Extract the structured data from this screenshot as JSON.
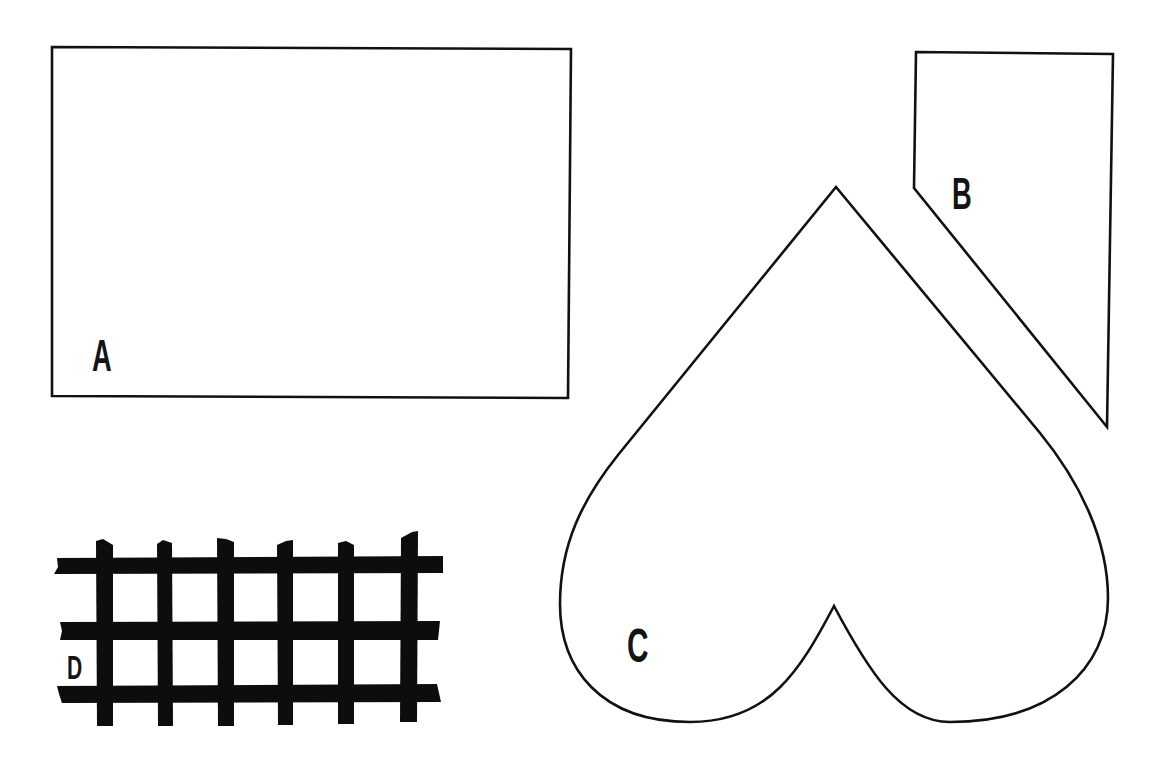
{
  "diagram": {
    "type": "pattern-pieces",
    "stroke_color": "#111111",
    "fill_color": "#ffffff",
    "background_color": "#ffffff",
    "shapes": [
      {
        "id": "A",
        "label": "A",
        "kind": "rectangle",
        "points": [
          [
            52,
            47
          ],
          [
            571,
            49
          ],
          [
            568,
            398
          ],
          [
            52,
            396
          ]
        ]
      },
      {
        "id": "B",
        "label": "B",
        "kind": "pentagon-wedge",
        "points": [
          [
            916,
            52
          ],
          [
            1113,
            54
          ],
          [
            1107,
            427
          ],
          [
            914,
            190
          ],
          [
            914,
            187
          ]
        ]
      },
      {
        "id": "C",
        "label": "C",
        "kind": "heart-inverted",
        "apex": [
          836,
          187
        ],
        "notch": [
          834,
          606
        ]
      },
      {
        "id": "D",
        "label": "D",
        "kind": "lattice",
        "horizontal_bars": 3,
        "vertical_bars": 6,
        "color": "#0d0d0d"
      }
    ]
  }
}
